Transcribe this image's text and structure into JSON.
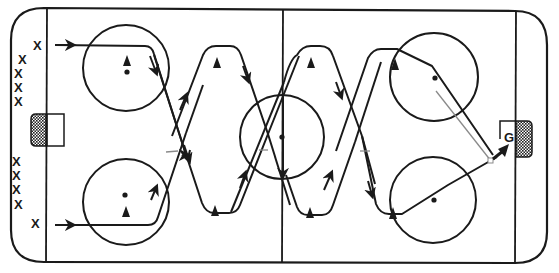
{
  "diagram": {
    "type": "hockey-drill",
    "surface": "ice rink (full)",
    "colors": {
      "ink": "#1a1a1a",
      "pass_line": "#8a8a8a",
      "background": "#ffffff"
    },
    "players": {
      "left_group_top": [
        "X",
        "X",
        "X",
        "X",
        "X"
      ],
      "left_group_bottom": [
        "X",
        "X",
        "X",
        "X",
        "X"
      ],
      "goalie_label": "G"
    },
    "cones": 10,
    "legend_symbols": {
      "skater": "X",
      "cone": "triangle",
      "goalie": "G",
      "skate_path": "solid line with arrow",
      "pass": "grey thin line",
      "shot": "bold arrow"
    }
  }
}
